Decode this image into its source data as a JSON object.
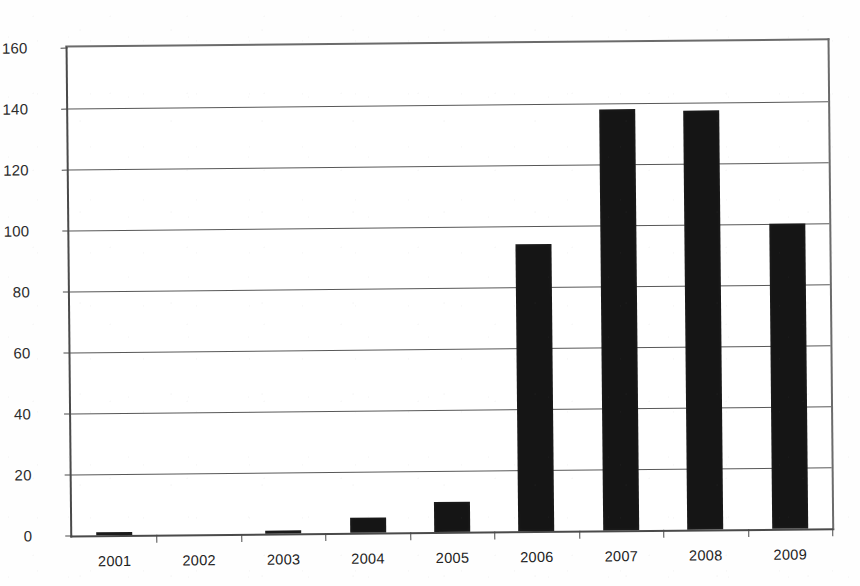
{
  "chart_data": {
    "type": "bar",
    "title": "",
    "subtitle": "",
    "xlabel": "",
    "ylabel": "",
    "categories": [
      "2001",
      "2002",
      "2003",
      "2004",
      "2005",
      "2006",
      "2007",
      "2008",
      "2009"
    ],
    "values": [
      1,
      0,
      1,
      5,
      10,
      94,
      138,
      137.5,
      100
    ],
    "ylim": [
      0,
      160
    ],
    "y_ticks": [
      0,
      20,
      40,
      60,
      80,
      100,
      120,
      140,
      160
    ],
    "y_tick_labels": [
      "0",
      "20",
      "40",
      "60",
      "80",
      "100",
      "120",
      "140",
      "160"
    ],
    "grid": true,
    "grid_axis": "y",
    "legend": false,
    "legend_position": "none",
    "bar_color": "#151515",
    "axis_color": "#4a4a4a",
    "gridline_color": "#585858",
    "background_color": "#ffffff"
  }
}
